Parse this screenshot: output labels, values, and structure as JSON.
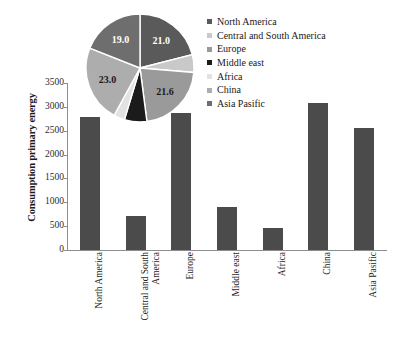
{
  "chart_data": [
    {
      "type": "bar",
      "title": "",
      "xlabel": "",
      "ylabel": "Consumption primary energy",
      "ylim": [
        0,
        3500
      ],
      "yticks": [
        0,
        500,
        1000,
        1500,
        2000,
        2500,
        3000,
        3500
      ],
      "ytick_labels": [
        "0",
        "500",
        "1000",
        "1500",
        "2000",
        "2500",
        "3000",
        "3500"
      ],
      "grid": false,
      "bar_color": "#4b4b4b",
      "categories": [
        "North America",
        "Central and South America",
        "Europe",
        "Middle east",
        "Africa",
        "China",
        "Asia Pasific"
      ],
      "values": [
        2790,
        720,
        2880,
        910,
        460,
        3080,
        2550
      ]
    },
    {
      "type": "pie",
      "title": "",
      "start_angle_deg": 0,
      "direction": "clockwise",
      "labels": [
        "North America",
        "Central and South America",
        "Europe",
        "Middle east",
        "Africa",
        "China",
        "Asia Pasific"
      ],
      "values": [
        21.0,
        5.3,
        21.6,
        6.7,
        3.3,
        23.0,
        19.0
      ],
      "data_labels": [
        "21.0",
        "5.3",
        "21.6",
        "6.7",
        "3.3",
        "23.0",
        "19.0"
      ],
      "colors": [
        "#5a5a5a",
        "#c9c9c9",
        "#9a9a9a",
        "#1b1b1b",
        "#e2e2e2",
        "#adadad",
        "#6e6e6e"
      ],
      "label_text_colors": [
        "#ffffff",
        "#1a1a1a",
        "#1a1a1a",
        "#111111",
        "#111111",
        "#1a1a1a",
        "#ffffff"
      ]
    }
  ],
  "legend": {
    "position": "top-right",
    "items": [
      {
        "label": "North America",
        "color": "#5a5a5a"
      },
      {
        "label": "Central and South America",
        "color": "#c9c9c9"
      },
      {
        "label": "Europe",
        "color": "#9a9a9a"
      },
      {
        "label": "Middle east",
        "color": "#1b1b1b"
      },
      {
        "label": "Africa",
        "color": "#e2e2e2"
      },
      {
        "label": "China",
        "color": "#adadad"
      },
      {
        "label": "Asia Pasific",
        "color": "#6e6e6e"
      }
    ]
  }
}
